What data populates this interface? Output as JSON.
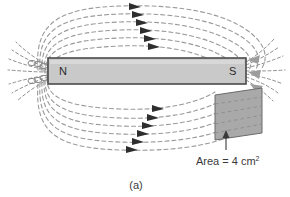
{
  "figure": {
    "caption": "(a)"
  },
  "magnet": {
    "north_label": "N",
    "south_label": "S",
    "fill_color": "#c9c9c9",
    "border_color": "#4a4a4a"
  },
  "field": {
    "line_color": "#9a9a9a",
    "arrow_color": "#2e2e2e",
    "dash_pattern": "4 3",
    "top_loop_count": 6,
    "bottom_loop_count": 6,
    "arrow_direction": "right"
  },
  "area_patch": {
    "fill_color": "#a9a9a9",
    "border_color": "#6a6a6a",
    "annotation_text": "Area = 4 cm",
    "annotation_exponent": "2",
    "annotation_value": 4,
    "annotation_unit": "cm^2"
  }
}
